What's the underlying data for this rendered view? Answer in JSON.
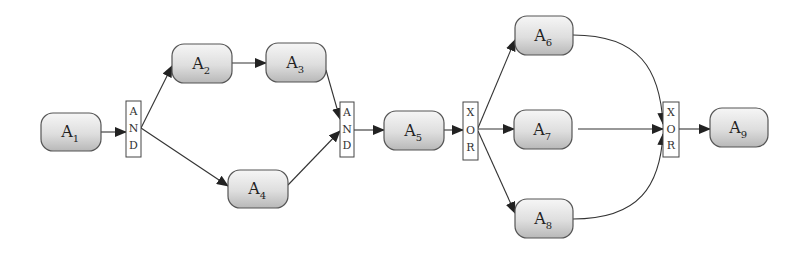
{
  "diagram": {
    "type": "workflow",
    "nodes": [
      {
        "id": "A1",
        "label": "A",
        "sub": "1",
        "x": 41,
        "y": 113,
        "w": 60,
        "h": 38
      },
      {
        "id": "A2",
        "label": "A",
        "sub": "2",
        "x": 172,
        "y": 44,
        "w": 60,
        "h": 39
      },
      {
        "id": "A3",
        "label": "A",
        "sub": "3",
        "x": 266,
        "y": 43,
        "w": 60,
        "h": 39
      },
      {
        "id": "A4",
        "label": "A",
        "sub": "4",
        "x": 228,
        "y": 170,
        "w": 60,
        "h": 38
      },
      {
        "id": "A5",
        "label": "A",
        "sub": "5",
        "x": 384,
        "y": 111,
        "w": 60,
        "h": 39
      },
      {
        "id": "A6",
        "label": "A",
        "sub": "6",
        "x": 515,
        "y": 16,
        "w": 58,
        "h": 39
      },
      {
        "id": "A7",
        "label": "A",
        "sub": "7",
        "x": 514,
        "y": 110,
        "w": 58,
        "h": 39
      },
      {
        "id": "A8",
        "label": "A",
        "sub": "8",
        "x": 515,
        "y": 199,
        "w": 58,
        "h": 39
      },
      {
        "id": "A9",
        "label": "A",
        "sub": "9",
        "x": 710,
        "y": 108,
        "w": 58,
        "h": 39
      }
    ],
    "gateways": [
      {
        "id": "G1",
        "type": "AND",
        "letters": [
          "A",
          "N",
          "D"
        ],
        "x": 126,
        "y": 101,
        "w": 15,
        "h": 56
      },
      {
        "id": "G2",
        "type": "AND",
        "letters": [
          "A",
          "N",
          "D"
        ],
        "x": 340,
        "y": 102,
        "w": 14,
        "h": 55
      },
      {
        "id": "G3",
        "type": "XOR",
        "letters": [
          "X",
          "O",
          "R"
        ],
        "x": 463,
        "y": 102,
        "w": 15,
        "h": 58
      },
      {
        "id": "G4",
        "type": "XOR",
        "letters": [
          "X",
          "O",
          "R"
        ],
        "x": 663,
        "y": 102,
        "w": 16,
        "h": 55
      }
    ],
    "edges": [
      {
        "from": "A1",
        "to": "G1"
      },
      {
        "from": "G1",
        "to": "A2"
      },
      {
        "from": "G1",
        "to": "A4"
      },
      {
        "from": "A2",
        "to": "A3"
      },
      {
        "from": "A3",
        "to": "G2"
      },
      {
        "from": "A4",
        "to": "G2"
      },
      {
        "from": "G2",
        "to": "A5"
      },
      {
        "from": "A5",
        "to": "G3"
      },
      {
        "from": "G3",
        "to": "A6"
      },
      {
        "from": "G3",
        "to": "A7"
      },
      {
        "from": "G3",
        "to": "A8"
      },
      {
        "from": "A6",
        "to": "G4"
      },
      {
        "from": "A7",
        "to": "G4"
      },
      {
        "from": "A8",
        "to": "G4"
      },
      {
        "from": "G4",
        "to": "A9"
      }
    ],
    "colors": {
      "node_fill_top": "#f4f4f4",
      "node_fill_bottom": "#bcbcbc",
      "node_stroke": "#555555",
      "edge": "#333333",
      "gateway_stroke": "#444444"
    }
  }
}
